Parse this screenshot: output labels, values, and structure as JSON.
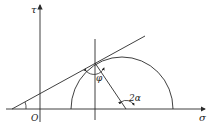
{
  "diagram": {
    "type": "mohr-circle",
    "labels": {
      "tau_axis": "τ",
      "sigma_axis": "σ",
      "origin": "O",
      "phi": "φ",
      "two_alpha": "2α"
    },
    "colors": {
      "stroke": "#2a2a2a",
      "background": "#ffffff"
    }
  }
}
